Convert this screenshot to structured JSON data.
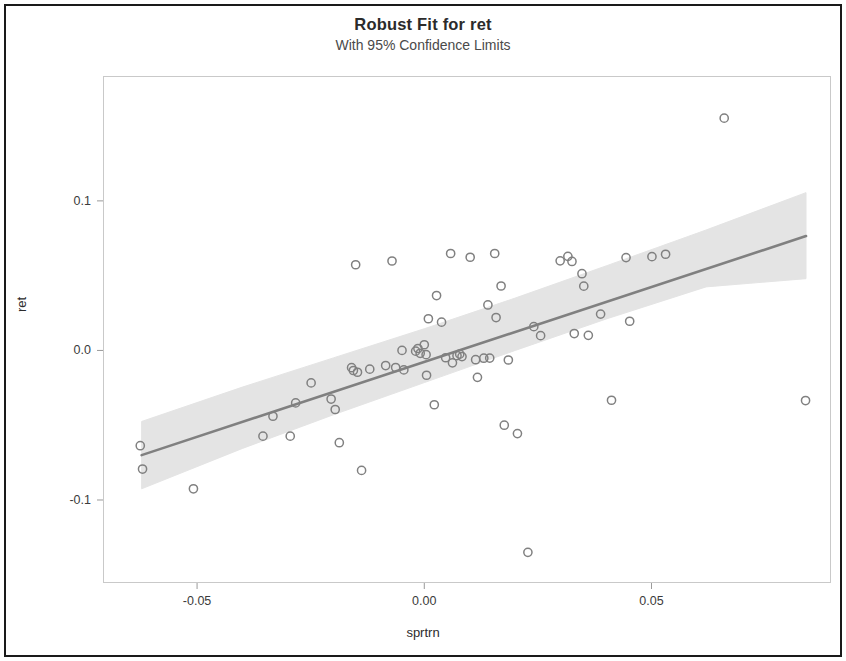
{
  "chart_data": {
    "type": "scatter",
    "title": "Robust Fit for ret",
    "subtitle": "With 95% Confidence Limits",
    "xlabel": "sprtrn",
    "ylabel": "ret",
    "xlim": [
      -0.0707,
      0.0895
    ],
    "ylim": [
      -0.1555,
      0.1835
    ],
    "xticks": [
      -0.05,
      0.0,
      0.05
    ],
    "xtick_labels": [
      "-0.05",
      "0.00",
      "0.05"
    ],
    "yticks": [
      0.1,
      0.0,
      -0.1
    ],
    "ytick_labels": [
      "0.1",
      "0.0",
      "-0.1"
    ],
    "grid": false,
    "legend": false,
    "marker": "open-circle",
    "marker_color": "#808080",
    "fit_line_color": "#808080",
    "confidence_band_color": "#e3e3e3",
    "confidence_level": 95,
    "fit": {
      "x_start": -0.0622,
      "y_start": -0.07,
      "x_end": 0.084,
      "y_end": 0.0765
    },
    "confidence_band": {
      "x": [
        -0.0622,
        -0.04,
        -0.02,
        0.0,
        0.02,
        0.04,
        0.062,
        0.084
      ],
      "upper": [
        -0.0475,
        -0.0245,
        -0.005,
        0.0145,
        0.035,
        0.0565,
        0.0805,
        0.1055
      ],
      "lower": [
        -0.0925,
        -0.0655,
        -0.043,
        -0.0215,
        0.0,
        0.021,
        0.0425,
        0.048
      ]
    },
    "points": [
      {
        "x": -0.0625,
        "y": -0.0637
      },
      {
        "x": -0.062,
        "y": -0.0793
      },
      {
        "x": -0.0508,
        "y": -0.0925
      },
      {
        "x": -0.0355,
        "y": -0.0573
      },
      {
        "x": -0.0333,
        "y": -0.044
      },
      {
        "x": -0.0295,
        "y": -0.0573
      },
      {
        "x": -0.0283,
        "y": -0.0351
      },
      {
        "x": -0.0249,
        "y": -0.0217
      },
      {
        "x": -0.0205,
        "y": -0.0325
      },
      {
        "x": -0.0196,
        "y": -0.0395
      },
      {
        "x": -0.0187,
        "y": -0.0617
      },
      {
        "x": -0.016,
        "y": -0.0115
      },
      {
        "x": -0.0156,
        "y": -0.0134
      },
      {
        "x": -0.0151,
        "y": 0.0573
      },
      {
        "x": -0.0147,
        "y": -0.0146
      },
      {
        "x": -0.0138,
        "y": -0.0802
      },
      {
        "x": -0.012,
        "y": -0.0125
      },
      {
        "x": -0.0085,
        "y": -0.0101
      },
      {
        "x": -0.0071,
        "y": 0.0598
      },
      {
        "x": -0.0063,
        "y": -0.0114
      },
      {
        "x": -0.0049,
        "y": 0.0
      },
      {
        "x": -0.0045,
        "y": -0.013
      },
      {
        "x": -0.0019,
        "y": -0.0005
      },
      {
        "x": -0.0014,
        "y": 0.0013
      },
      {
        "x": -0.0009,
        "y": -0.0019
      },
      {
        "x": 0.0,
        "y": 0.0038
      },
      {
        "x": 0.0004,
        "y": -0.0028
      },
      {
        "x": 0.0005,
        "y": -0.0166
      },
      {
        "x": 0.0009,
        "y": 0.0212
      },
      {
        "x": 0.0022,
        "y": -0.0363
      },
      {
        "x": 0.0027,
        "y": 0.0367
      },
      {
        "x": 0.0038,
        "y": 0.0189
      },
      {
        "x": 0.0047,
        "y": -0.0049
      },
      {
        "x": 0.0058,
        "y": 0.0648
      },
      {
        "x": 0.0062,
        "y": -0.0083
      },
      {
        "x": 0.0072,
        "y": -0.0035
      },
      {
        "x": 0.0078,
        "y": -0.0025
      },
      {
        "x": 0.0083,
        "y": -0.0041
      },
      {
        "x": 0.0101,
        "y": 0.0623
      },
      {
        "x": 0.0113,
        "y": -0.0062
      },
      {
        "x": 0.0117,
        "y": -0.018
      },
      {
        "x": 0.0131,
        "y": -0.0052
      },
      {
        "x": 0.014,
        "y": 0.0304
      },
      {
        "x": 0.0144,
        "y": -0.0051
      },
      {
        "x": 0.0155,
        "y": 0.0648
      },
      {
        "x": 0.0158,
        "y": 0.022
      },
      {
        "x": 0.0169,
        "y": 0.0431
      },
      {
        "x": 0.0176,
        "y": -0.05
      },
      {
        "x": 0.0185,
        "y": -0.0064
      },
      {
        "x": 0.0205,
        "y": -0.0556
      },
      {
        "x": 0.0228,
        "y": -0.135
      },
      {
        "x": 0.0241,
        "y": 0.0159
      },
      {
        "x": 0.0256,
        "y": 0.0099
      },
      {
        "x": 0.0299,
        "y": 0.0599
      },
      {
        "x": 0.0316,
        "y": 0.0629
      },
      {
        "x": 0.0325,
        "y": 0.0595
      },
      {
        "x": 0.033,
        "y": 0.0113
      },
      {
        "x": 0.0347,
        "y": 0.0513
      },
      {
        "x": 0.0351,
        "y": 0.043
      },
      {
        "x": 0.0361,
        "y": 0.0101
      },
      {
        "x": 0.0388,
        "y": 0.0243
      },
      {
        "x": 0.0412,
        "y": -0.0333
      },
      {
        "x": 0.0444,
        "y": 0.0621
      },
      {
        "x": 0.0452,
        "y": 0.0195
      },
      {
        "x": 0.0501,
        "y": 0.0627
      },
      {
        "x": 0.0531,
        "y": 0.0643
      },
      {
        "x": 0.066,
        "y": 0.1553
      },
      {
        "x": 0.0839,
        "y": -0.0335
      }
    ]
  }
}
